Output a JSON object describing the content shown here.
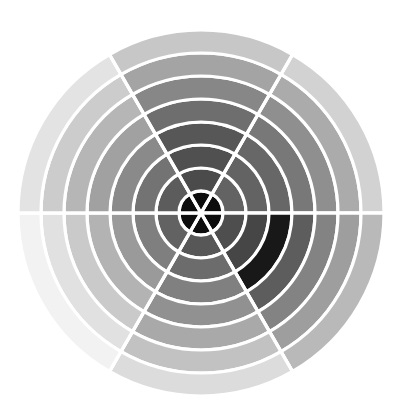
{
  "chart_data": {
    "type": "heatmap",
    "subtype": "polar-sector-heatmap",
    "title": "",
    "subtitle": "",
    "xlabel": "",
    "ylabel": "",
    "grid": true,
    "legend": "none",
    "background_color": "#ffffff",
    "gap_color": "#ffffff",
    "center_x": 201,
    "center_y": 213,
    "inner_radius": 0,
    "outer_radius": 183,
    "sector_count": 6,
    "ring_count": 8,
    "sector_angle_degrees": 60,
    "angle_offset_degrees": 0,
    "sector_labels": [
      "S1 (0°–60°)",
      "S2 (60°–120°)",
      "S3 (120°–180°)",
      "S4 (180°–240°)",
      "S5 (240°–300°)",
      "S6 (300°–360°)"
    ],
    "ring_labels": [
      "R1",
      "R2",
      "R3",
      "R4",
      "R5",
      "R6",
      "R7",
      "R8"
    ],
    "ring_radii": [
      22,
      45,
      68,
      91,
      114,
      137,
      160,
      183
    ],
    "colormap": "gray",
    "value_range": [
      0,
      1
    ],
    "cells": [
      {
        "sector": 0,
        "ring": 0,
        "value": 0.03,
        "color": "#0d0d0d"
      },
      {
        "sector": 0,
        "ring": 1,
        "value": 0.38,
        "color": "#636363"
      },
      {
        "sector": 0,
        "ring": 2,
        "value": 0.38,
        "color": "#636363"
      },
      {
        "sector": 0,
        "ring": 3,
        "value": 0.4,
        "color": "#676767"
      },
      {
        "sector": 0,
        "ring": 4,
        "value": 0.47,
        "color": "#787878"
      },
      {
        "sector": 0,
        "ring": 5,
        "value": 0.56,
        "color": "#8f8f8f"
      },
      {
        "sector": 0,
        "ring": 6,
        "value": 0.67,
        "color": "#ababab"
      },
      {
        "sector": 0,
        "ring": 7,
        "value": 0.82,
        "color": "#d2d2d2"
      },
      {
        "sector": 1,
        "ring": 0,
        "value": 0.03,
        "color": "#0d0d0d"
      },
      {
        "sector": 1,
        "ring": 1,
        "value": 0.3,
        "color": "#4e4e4e"
      },
      {
        "sector": 1,
        "ring": 2,
        "value": 0.27,
        "color": "#464646"
      },
      {
        "sector": 1,
        "ring": 3,
        "value": 0.08,
        "color": "#181818"
      },
      {
        "sector": 1,
        "ring": 4,
        "value": 0.36,
        "color": "#5d5d5d"
      },
      {
        "sector": 1,
        "ring": 5,
        "value": 0.51,
        "color": "#838383"
      },
      {
        "sector": 1,
        "ring": 6,
        "value": 0.62,
        "color": "#9e9e9e"
      },
      {
        "sector": 1,
        "ring": 7,
        "value": 0.72,
        "color": "#b9b9b9"
      },
      {
        "sector": 2,
        "ring": 0,
        "value": 0.03,
        "color": "#0d0d0d"
      },
      {
        "sector": 2,
        "ring": 1,
        "value": 0.34,
        "color": "#575757"
      },
      {
        "sector": 2,
        "ring": 2,
        "value": 0.42,
        "color": "#6c6c6c"
      },
      {
        "sector": 2,
        "ring": 3,
        "value": 0.5,
        "color": "#808080"
      },
      {
        "sector": 2,
        "ring": 4,
        "value": 0.57,
        "color": "#919191"
      },
      {
        "sector": 2,
        "ring": 5,
        "value": 0.66,
        "color": "#a9a9a9"
      },
      {
        "sector": 2,
        "ring": 6,
        "value": 0.76,
        "color": "#c2c2c2"
      },
      {
        "sector": 2,
        "ring": 7,
        "value": 0.86,
        "color": "#dcdcdc"
      },
      {
        "sector": 3,
        "ring": 0,
        "value": 0.03,
        "color": "#0d0d0d"
      },
      {
        "sector": 3,
        "ring": 1,
        "value": 0.38,
        "color": "#626262"
      },
      {
        "sector": 3,
        "ring": 2,
        "value": 0.5,
        "color": "#7f7f7f"
      },
      {
        "sector": 3,
        "ring": 3,
        "value": 0.6,
        "color": "#9a9a9a"
      },
      {
        "sector": 3,
        "ring": 4,
        "value": 0.7,
        "color": "#b3b3b3"
      },
      {
        "sector": 3,
        "ring": 5,
        "value": 0.79,
        "color": "#cacaca"
      },
      {
        "sector": 3,
        "ring": 6,
        "value": 0.88,
        "color": "#e1e1e1"
      },
      {
        "sector": 3,
        "ring": 7,
        "value": 0.95,
        "color": "#f2f2f2"
      },
      {
        "sector": 4,
        "ring": 0,
        "value": 0.03,
        "color": "#0d0d0d"
      },
      {
        "sector": 4,
        "ring": 1,
        "value": 0.36,
        "color": "#5c5c5c"
      },
      {
        "sector": 4,
        "ring": 2,
        "value": 0.45,
        "color": "#737373"
      },
      {
        "sector": 4,
        "ring": 3,
        "value": 0.54,
        "color": "#8a8a8a"
      },
      {
        "sector": 4,
        "ring": 4,
        "value": 0.63,
        "color": "#a1a1a1"
      },
      {
        "sector": 4,
        "ring": 5,
        "value": 0.71,
        "color": "#b6b6b6"
      },
      {
        "sector": 4,
        "ring": 6,
        "value": 0.8,
        "color": "#cccccc"
      },
      {
        "sector": 4,
        "ring": 7,
        "value": 0.89,
        "color": "#e3e3e3"
      },
      {
        "sector": 5,
        "ring": 0,
        "value": 0.03,
        "color": "#0d0d0d"
      },
      {
        "sector": 5,
        "ring": 1,
        "value": 0.29,
        "color": "#4b4b4b"
      },
      {
        "sector": 5,
        "ring": 2,
        "value": 0.31,
        "color": "#505050"
      },
      {
        "sector": 5,
        "ring": 3,
        "value": 0.34,
        "color": "#575757"
      },
      {
        "sector": 5,
        "ring": 4,
        "value": 0.43,
        "color": "#6e6e6e"
      },
      {
        "sector": 5,
        "ring": 5,
        "value": 0.53,
        "color": "#878787"
      },
      {
        "sector": 5,
        "ring": 6,
        "value": 0.64,
        "color": "#a4a4a4"
      },
      {
        "sector": 5,
        "ring": 7,
        "value": 0.78,
        "color": "#c7c7c7"
      }
    ],
    "spokes": [
      {
        "angle": 0
      },
      {
        "angle": 60
      },
      {
        "angle": 120
      },
      {
        "angle": 180
      },
      {
        "angle": 240
      },
      {
        "angle": 300
      }
    ]
  }
}
